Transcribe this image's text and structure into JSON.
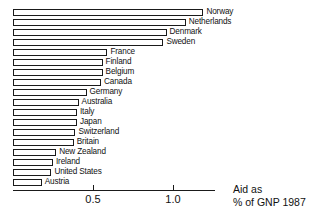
{
  "chart_data": {
    "type": "bar",
    "orientation": "horizontal",
    "title": "",
    "subtitle": "",
    "xlabel": "Aid as % of GNP 1987",
    "ylabel": "",
    "xlim": [
      0,
      1.26
    ],
    "grid": false,
    "legend": null,
    "tick_labels": [
      "0.5",
      "1.0"
    ],
    "tick_values": [
      0.5,
      1.0
    ],
    "categories": [
      "Norway",
      "Netherlands",
      "Denmark",
      "Sweden",
      "France",
      "Finland",
      "Belgium",
      "Canada",
      "Germany",
      "Australia",
      "Italy",
      "Japan",
      "Switzerland",
      "Britain",
      "New Zealand",
      "Ireland",
      "United States",
      "Austria"
    ],
    "values": [
      1.19,
      1.08,
      0.96,
      0.94,
      0.59,
      0.56,
      0.56,
      0.55,
      0.46,
      0.41,
      0.4,
      0.4,
      0.39,
      0.38,
      0.27,
      0.25,
      0.24,
      0.18
    ]
  },
  "caption": {
    "line1": "Aid as",
    "line2": "% of GNP 1987"
  },
  "colors": {
    "bar_fill": "#ffffff",
    "bar_stroke": "#1a1a1a",
    "text": "#111111",
    "axis": "#1a1a1a",
    "background": "#ffffff"
  }
}
